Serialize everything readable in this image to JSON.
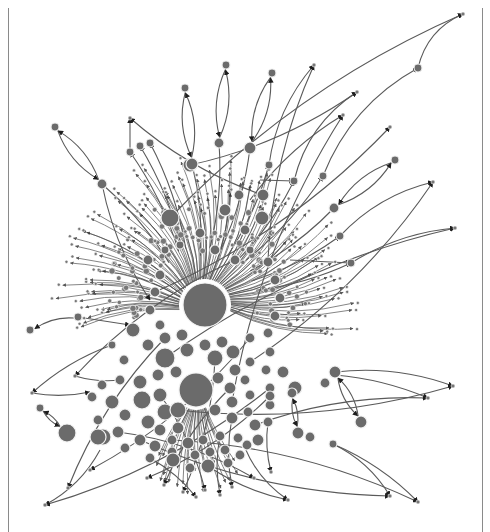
{
  "figure": {
    "type": "directed-network-graph",
    "layout": "force-directed",
    "colors": {
      "background": "#ffffff",
      "node_fill": "#6b6b6b",
      "node_stroke": "#f2f2f2",
      "edge": "#5a5a5a",
      "arrowhead": "#1e1e1e",
      "border": "#8a8a8a"
    },
    "borders": {
      "left_x": 8,
      "right_x": 482
    },
    "hubs": [
      {
        "id": "hub-1",
        "x": 205,
        "y": 305,
        "r": 22
      },
      {
        "id": "hub-2",
        "x": 196,
        "y": 390,
        "r": 17
      }
    ],
    "cluster_nodes": [
      {
        "x": 170,
        "y": 218,
        "r": 9
      },
      {
        "x": 200,
        "y": 233,
        "r": 5
      },
      {
        "x": 225,
        "y": 210,
        "r": 6
      },
      {
        "x": 245,
        "y": 230,
        "r": 5
      },
      {
        "x": 262,
        "y": 218,
        "r": 7
      },
      {
        "x": 263,
        "y": 195,
        "r": 6
      },
      {
        "x": 239,
        "y": 195,
        "r": 5
      },
      {
        "x": 190,
        "y": 165,
        "r": 7
      },
      {
        "x": 148,
        "y": 260,
        "r": 5
      },
      {
        "x": 165,
        "y": 250,
        "r": 4
      },
      {
        "x": 180,
        "y": 245,
        "r": 4
      },
      {
        "x": 215,
        "y": 250,
        "r": 5
      },
      {
        "x": 235,
        "y": 260,
        "r": 5
      },
      {
        "x": 250,
        "y": 250,
        "r": 4
      },
      {
        "x": 268,
        "y": 262,
        "r": 5
      },
      {
        "x": 275,
        "y": 280,
        "r": 5
      },
      {
        "x": 280,
        "y": 298,
        "r": 5
      },
      {
        "x": 275,
        "y": 316,
        "r": 5
      },
      {
        "x": 268,
        "y": 333,
        "r": 5
      },
      {
        "x": 250,
        "y": 338,
        "r": 5
      },
      {
        "x": 160,
        "y": 275,
        "r": 5
      },
      {
        "x": 155,
        "y": 292,
        "r": 5
      },
      {
        "x": 150,
        "y": 310,
        "r": 5
      },
      {
        "x": 160,
        "y": 325,
        "r": 5
      },
      {
        "x": 133,
        "y": 330,
        "r": 7
      },
      {
        "x": 148,
        "y": 345,
        "r": 6
      },
      {
        "x": 165,
        "y": 338,
        "r": 6
      },
      {
        "x": 182,
        "y": 335,
        "r": 6
      },
      {
        "x": 165,
        "y": 358,
        "r": 10
      },
      {
        "x": 187,
        "y": 350,
        "r": 7
      },
      {
        "x": 205,
        "y": 345,
        "r": 6
      },
      {
        "x": 222,
        "y": 342,
        "r": 6
      },
      {
        "x": 233,
        "y": 352,
        "r": 7
      },
      {
        "x": 215,
        "y": 358,
        "r": 8
      },
      {
        "x": 235,
        "y": 370,
        "r": 6
      },
      {
        "x": 250,
        "y": 362,
        "r": 5
      },
      {
        "x": 140,
        "y": 382,
        "r": 7
      },
      {
        "x": 158,
        "y": 375,
        "r": 6
      },
      {
        "x": 176,
        "y": 372,
        "r": 6
      },
      {
        "x": 218,
        "y": 378,
        "r": 6
      },
      {
        "x": 230,
        "y": 388,
        "r": 6
      },
      {
        "x": 245,
        "y": 380,
        "r": 5
      },
      {
        "x": 232,
        "y": 402,
        "r": 6
      },
      {
        "x": 250,
        "y": 395,
        "r": 5
      },
      {
        "x": 112,
        "y": 402,
        "r": 7
      },
      {
        "x": 125,
        "y": 415,
        "r": 6
      },
      {
        "x": 142,
        "y": 400,
        "r": 9
      },
      {
        "x": 160,
        "y": 395,
        "r": 7
      },
      {
        "x": 165,
        "y": 412,
        "r": 8
      },
      {
        "x": 178,
        "y": 410,
        "r": 8
      },
      {
        "x": 148,
        "y": 422,
        "r": 7
      },
      {
        "x": 160,
        "y": 430,
        "r": 6
      },
      {
        "x": 178,
        "y": 428,
        "r": 6
      },
      {
        "x": 215,
        "y": 410,
        "r": 6
      },
      {
        "x": 232,
        "y": 418,
        "r": 6
      },
      {
        "x": 248,
        "y": 412,
        "r": 5
      },
      {
        "x": 255,
        "y": 425,
        "r": 6
      },
      {
        "x": 102,
        "y": 385,
        "r": 5
      },
      {
        "x": 92,
        "y": 397,
        "r": 5
      },
      {
        "x": 98,
        "y": 420,
        "r": 5
      },
      {
        "x": 103,
        "y": 437,
        "r": 8
      },
      {
        "x": 118,
        "y": 432,
        "r": 6
      },
      {
        "x": 125,
        "y": 448,
        "r": 5
      },
      {
        "x": 140,
        "y": 440,
        "r": 6
      },
      {
        "x": 155,
        "y": 446,
        "r": 6
      },
      {
        "x": 172,
        "y": 452,
        "r": 5
      },
      {
        "x": 188,
        "y": 443,
        "r": 6
      },
      {
        "x": 203,
        "y": 440,
        "r": 5
      },
      {
        "x": 220,
        "y": 436,
        "r": 5
      },
      {
        "x": 238,
        "y": 438,
        "r": 5
      },
      {
        "x": 172,
        "y": 440,
        "r": 5
      },
      {
        "x": 195,
        "y": 455,
        "r": 5
      },
      {
        "x": 210,
        "y": 452,
        "r": 5
      },
      {
        "x": 225,
        "y": 450,
        "r": 5
      },
      {
        "x": 240,
        "y": 455,
        "r": 5
      },
      {
        "x": 150,
        "y": 458,
        "r": 5
      },
      {
        "x": 173,
        "y": 460,
        "r": 7
      },
      {
        "x": 208,
        "y": 466,
        "r": 7
      },
      {
        "x": 190,
        "y": 468,
        "r": 5
      },
      {
        "x": 228,
        "y": 463,
        "r": 5
      },
      {
        "x": 247,
        "y": 445,
        "r": 5
      },
      {
        "x": 258,
        "y": 440,
        "r": 6
      },
      {
        "x": 268,
        "y": 422,
        "r": 5
      },
      {
        "x": 270,
        "y": 405,
        "r": 5
      },
      {
        "x": 270,
        "y": 388,
        "r": 5
      },
      {
        "x": 266,
        "y": 370,
        "r": 5
      },
      {
        "x": 270,
        "y": 352,
        "r": 5
      },
      {
        "x": 283,
        "y": 372,
        "r": 6
      },
      {
        "x": 295,
        "y": 388,
        "r": 7
      },
      {
        "x": 270,
        "y": 396,
        "r": 5
      },
      {
        "x": 124,
        "y": 360,
        "r": 5
      },
      {
        "x": 112,
        "y": 345,
        "r": 4
      },
      {
        "x": 120,
        "y": 380,
        "r": 5
      }
    ],
    "satellite_nodes": [
      {
        "id": "s1",
        "x": 55,
        "y": 127,
        "r": 4
      },
      {
        "id": "s2",
        "x": 102,
        "y": 184,
        "r": 5
      },
      {
        "id": "s3",
        "x": 130,
        "y": 152,
        "r": 4
      },
      {
        "id": "s4",
        "x": 140,
        "y": 146,
        "r": 4
      },
      {
        "id": "s5",
        "x": 150,
        "y": 143,
        "r": 4
      },
      {
        "id": "s6",
        "x": 185,
        "y": 88,
        "r": 4
      },
      {
        "id": "s7",
        "x": 192,
        "y": 164,
        "r": 6
      },
      {
        "id": "s8",
        "x": 226,
        "y": 65,
        "r": 4
      },
      {
        "id": "s9",
        "x": 219,
        "y": 143,
        "r": 5
      },
      {
        "id": "s10",
        "x": 272,
        "y": 73,
        "r": 4
      },
      {
        "id": "s11",
        "x": 250,
        "y": 148,
        "r": 6
      },
      {
        "id": "s12",
        "x": 269,
        "y": 165,
        "r": 4
      },
      {
        "id": "s13",
        "x": 294,
        "y": 181,
        "r": 4
      },
      {
        "id": "s14",
        "x": 323,
        "y": 176,
        "r": 4
      },
      {
        "id": "s15",
        "x": 418,
        "y": 68,
        "r": 4
      },
      {
        "id": "s16",
        "x": 395,
        "y": 160,
        "r": 4
      },
      {
        "id": "s17",
        "x": 334,
        "y": 208,
        "r": 5
      },
      {
        "id": "s18",
        "x": 340,
        "y": 236,
        "r": 4
      },
      {
        "id": "s19",
        "x": 351,
        "y": 263,
        "r": 4
      },
      {
        "id": "s20",
        "x": 78,
        "y": 317,
        "r": 4
      },
      {
        "id": "s21",
        "x": 30,
        "y": 330,
        "r": 4
      },
      {
        "id": "s22",
        "x": 40,
        "y": 408,
        "r": 4
      },
      {
        "id": "s23",
        "x": 67,
        "y": 433,
        "r": 9
      },
      {
        "id": "s24",
        "x": 98,
        "y": 437,
        "r": 8
      },
      {
        "id": "s25",
        "x": 335,
        "y": 372,
        "r": 6
      },
      {
        "id": "s26",
        "x": 325,
        "y": 383,
        "r": 5
      },
      {
        "id": "s27",
        "x": 292,
        "y": 393,
        "r": 5
      },
      {
        "id": "s28",
        "x": 361,
        "y": 422,
        "r": 6
      },
      {
        "id": "s29",
        "x": 298,
        "y": 433,
        "r": 6
      },
      {
        "id": "s30",
        "x": 310,
        "y": 437,
        "r": 5
      },
      {
        "id": "s31",
        "x": 333,
        "y": 444,
        "r": 4
      }
    ],
    "leaf_targets": [
      {
        "x": 463,
        "y": 14
      },
      {
        "x": 357,
        "y": 92
      },
      {
        "x": 314,
        "y": 65
      },
      {
        "x": 390,
        "y": 127
      },
      {
        "x": 455,
        "y": 228
      },
      {
        "x": 433,
        "y": 182
      },
      {
        "x": 343,
        "y": 115
      },
      {
        "x": 453,
        "y": 386
      },
      {
        "x": 428,
        "y": 398
      },
      {
        "x": 390,
        "y": 496
      },
      {
        "x": 418,
        "y": 502
      },
      {
        "x": 288,
        "y": 500
      },
      {
        "x": 45,
        "y": 505
      },
      {
        "x": 32,
        "y": 393
      },
      {
        "x": 130,
        "y": 118
      },
      {
        "x": 75,
        "y": 376
      },
      {
        "x": 90,
        "y": 470
      },
      {
        "x": 68,
        "y": 488
      },
      {
        "x": 183,
        "y": 492
      },
      {
        "x": 164,
        "y": 485
      },
      {
        "x": 205,
        "y": 490
      },
      {
        "x": 232,
        "y": 487
      },
      {
        "x": 254,
        "y": 478
      },
      {
        "x": 220,
        "y": 495
      },
      {
        "x": 196,
        "y": 497
      },
      {
        "x": 271,
        "y": 472
      },
      {
        "x": 147,
        "y": 478
      }
    ],
    "satellite_edges": [
      [
        "s1",
        "s2"
      ],
      [
        "s2",
        "s1"
      ],
      [
        "s6",
        "s7"
      ],
      [
        "s7",
        "s6"
      ],
      [
        "s8",
        "s9"
      ],
      [
        "s9",
        "s8"
      ],
      [
        "s10",
        "s11"
      ],
      [
        "s11",
        "s10"
      ],
      [
        "s16",
        "s17"
      ],
      [
        "s17",
        "s16"
      ],
      [
        "s20",
        "s21"
      ],
      [
        "s22",
        "s23"
      ],
      [
        "s23",
        "s22"
      ],
      [
        "s25",
        "s28"
      ],
      [
        "s28",
        "s25"
      ],
      [
        "s27",
        "s29"
      ],
      [
        "s29",
        "s27"
      ]
    ],
    "long_edges": [
      {
        "from": [
          418,
          68
        ],
        "to": [
          463,
          14
        ],
        "bend": -0.25
      },
      {
        "from": [
          323,
          176
        ],
        "to": [
          418,
          68
        ],
        "bend": -0.18
      },
      {
        "from": [
          294,
          181
        ],
        "to": [
          357,
          92
        ],
        "bend": -0.2
      },
      {
        "from": [
          269,
          165
        ],
        "to": [
          314,
          65
        ],
        "bend": -0.15
      },
      {
        "from": [
          250,
          200
        ],
        "to": [
          343,
          115
        ],
        "bend": -0.1
      },
      {
        "from": [
          260,
          180
        ],
        "to": [
          294,
          181
        ],
        "bend": 0.0
      },
      {
        "from": [
          340,
          236
        ],
        "to": [
          433,
          182
        ],
        "bend": -0.15
      },
      {
        "from": [
          351,
          263
        ],
        "to": [
          455,
          228
        ],
        "bend": -0.12
      },
      {
        "from": [
          290,
          260
        ],
        "to": [
          351,
          263
        ],
        "bend": 0.0
      },
      {
        "from": [
          335,
          372
        ],
        "to": [
          453,
          386
        ],
        "bend": -0.12
      },
      {
        "from": [
          335,
          375
        ],
        "to": [
          428,
          398
        ],
        "bend": -0.08
      },
      {
        "from": [
          333,
          444
        ],
        "to": [
          390,
          496
        ],
        "bend": -0.15
      },
      {
        "from": [
          333,
          444
        ],
        "to": [
          418,
          502
        ],
        "bend": -0.1
      },
      {
        "from": [
          245,
          448
        ],
        "to": [
          288,
          500
        ],
        "bend": 0.15
      },
      {
        "from": [
          100,
          450
        ],
        "to": [
          45,
          505
        ],
        "bend": -0.15
      },
      {
        "from": [
          102,
          184
        ],
        "to": [
          150,
          300
        ],
        "bend": 0.1
      },
      {
        "from": [
          130,
          152
        ],
        "to": [
          130,
          118
        ],
        "bend": 0.0
      },
      {
        "from": [
          78,
          317
        ],
        "to": [
          130,
          325
        ],
        "bend": 0.0
      },
      {
        "from": [
          75,
          376
        ],
        "to": [
          120,
          380
        ],
        "bend": 0.1
      },
      {
        "from": [
          32,
          393
        ],
        "to": [
          90,
          392
        ],
        "bend": 0.1
      }
    ],
    "radial_burst": {
      "count": 120,
      "inner_r": 26,
      "outer_min": 95,
      "outer_max": 150,
      "angle_from": -190,
      "angle_to": 15
    }
  }
}
